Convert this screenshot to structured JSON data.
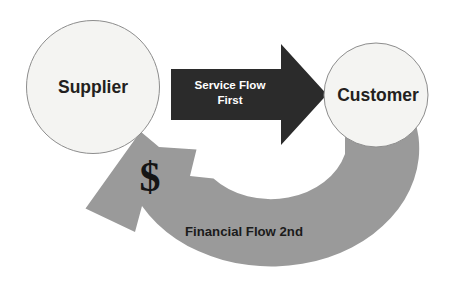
{
  "diagram": {
    "background_color": "#ffffff",
    "nodes": [
      {
        "id": "supplier",
        "label": "Supplier",
        "shape": "circle",
        "fill_color": "#f4f4f2",
        "stroke_color": "#8d8d8d",
        "text_color": "#231f20",
        "cx": 93,
        "cy": 87,
        "r": 67
      },
      {
        "id": "customer",
        "label": "Customer",
        "shape": "circle",
        "fill_color": "#f4f4f2",
        "stroke_color": "#8d8d8d",
        "text_color": "#231f20",
        "cx": 376,
        "cy": 95,
        "r": 52
      }
    ],
    "flows": [
      {
        "id": "service-flow",
        "label_line1": "Service Flow",
        "label_line2": "First",
        "direction": "supplier-to-customer",
        "style": "straight-block-arrow",
        "fill_color": "#2b2b2b",
        "text_color": "#ffffff",
        "order": "First"
      },
      {
        "id": "financial-flow",
        "label": "Financial Flow 2nd",
        "symbol": "$",
        "direction": "customer-to-supplier",
        "style": "curved-block-arrow",
        "fill_color": "#9a9a9a",
        "text_color": "#1b1b1b",
        "order": "2nd"
      }
    ]
  }
}
